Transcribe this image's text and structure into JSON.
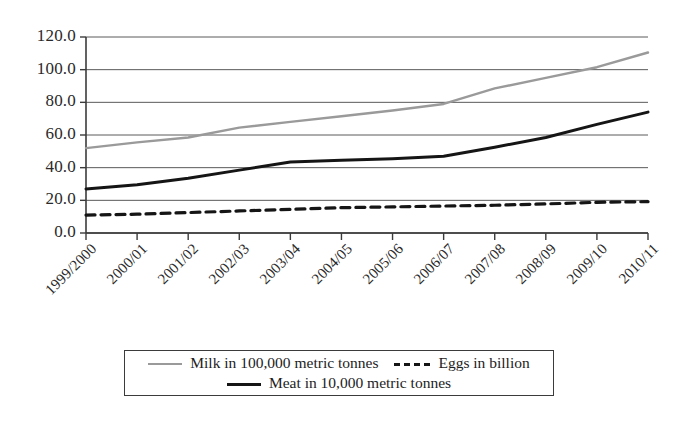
{
  "chart_data": {
    "type": "line",
    "title": "",
    "xlabel": "",
    "ylabel": "",
    "ylim": [
      0,
      120
    ],
    "yticks": [
      "0.0",
      "20.0",
      "40.0",
      "60.0",
      "80.0",
      "100.0",
      "120.0"
    ],
    "ytick_values": [
      0,
      20,
      40,
      60,
      80,
      100,
      120
    ],
    "grid": true,
    "legend_position": "below-plot",
    "categories": [
      "1999/2000",
      "2000/01",
      "2001/02",
      "2002/03",
      "2003/04",
      "2004/05",
      "2005/06",
      "2006/07",
      "2007/08",
      "2008/09",
      "2009/10",
      "2010/11"
    ],
    "series": [
      {
        "name": "Milk in 100,000 metric tonnes",
        "style": "solid",
        "color": "#9a9a9a",
        "width": 2.4,
        "values": [
          52.0,
          55.5,
          58.5,
          64.5,
          68.0,
          71.5,
          75.0,
          79.0,
          88.5,
          95.0,
          101.5,
          110.5
        ]
      },
      {
        "name": "Meat in 10,000 metric tonnes",
        "style": "solid",
        "color": "#151515",
        "width": 3.0,
        "values": [
          27.0,
          29.5,
          33.5,
          38.5,
          43.5,
          44.5,
          45.5,
          47.0,
          52.5,
          58.5,
          66.5,
          74.0
        ]
      },
      {
        "name": "Eggs in billion",
        "style": "dashed",
        "color": "#151515",
        "width": 3.2,
        "values": [
          11.0,
          11.5,
          12.5,
          13.5,
          14.5,
          15.5,
          16.0,
          16.5,
          17.0,
          17.8,
          18.8,
          19.2
        ]
      }
    ]
  },
  "legend": {
    "rows": [
      [
        {
          "label": "Milk in 100,000 metric tonnes",
          "swatch": "swatch-milk"
        },
        {
          "label": "Eggs in billion",
          "swatch": "swatch-eggs"
        }
      ],
      [
        {
          "label": "Meat in 10,000 metric tonnes",
          "swatch": "swatch-meat"
        }
      ]
    ]
  },
  "colors": {
    "milk": "#9a9a9a",
    "meat": "#151515",
    "eggs": "#151515",
    "axis": "#3b3b3b",
    "grid": "#5a5a5a",
    "background": "#ffffff"
  }
}
